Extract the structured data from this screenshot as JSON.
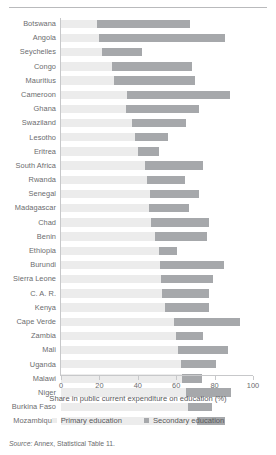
{
  "chart_data": {
    "type": "bar",
    "orientation": "horizontal",
    "stacked": true,
    "title": "",
    "xlabel": "Share in public current expenditure on education (%)",
    "ylabel": "",
    "xlim": [
      0,
      100
    ],
    "xticks": [
      0,
      20,
      40,
      60,
      80,
      100
    ],
    "grid": false,
    "legend_position": "bottom",
    "categories": [
      "Botswana",
      "Angola",
      "Seychelles",
      "Congo",
      "Mauritius",
      "Cameroon",
      "Ghana",
      "Swaziland",
      "Lesotho",
      "Eritrea",
      "South Africa",
      "Rwanda",
      "Senegal",
      "Madagascar",
      "Chad",
      "Benin",
      "Ethiopia",
      "Burundi",
      "Sierra Leone",
      "C. A. R.",
      "Kenya",
      "Cape Verde",
      "Zambia",
      "Mali",
      "Uganda",
      "Malawi",
      "Niger",
      "Burkina Faso",
      "Mozambique"
    ],
    "series": [
      {
        "name": "Primary education",
        "color": "#ececec",
        "values": [
          18.6,
          20.0,
          21.2,
          26.4,
          27.8,
          34.3,
          33.8,
          37.2,
          38.3,
          40.0,
          43.8,
          44.7,
          46.1,
          45.9,
          47.0,
          49.0,
          50.8,
          51.6,
          52.2,
          52.5,
          54.3,
          59.1,
          59.8,
          60.9,
          62.6,
          62.9,
          65.0,
          66.0,
          70.7
        ]
      },
      {
        "name": "Secondary education",
        "color": "#a6a8ab",
        "values": [
          48.7,
          65.6,
          21.2,
          41.7,
          42.1,
          53.9,
          38.2,
          27.8,
          17.2,
          10.8,
          30.1,
          20.0,
          25.6,
          21.0,
          29.9,
          27.0,
          9.5,
          33.1,
          26.8,
          24.7,
          22.9,
          34.3,
          14.1,
          26.1,
          18.3,
          10.5,
          23.7,
          12.6,
          14.9
        ]
      }
    ],
    "totals": [
      67.3,
      85.6,
      42.4,
      68.1,
      69.9,
      88.2,
      72.0,
      65.0,
      55.5,
      50.8,
      73.9,
      64.7,
      71.7,
      66.9,
      76.9,
      76.0,
      60.3,
      84.7,
      79.0,
      77.2,
      77.2,
      93.4,
      73.9,
      87.0,
      80.9,
      73.4,
      88.7,
      78.6,
      85.6
    ]
  },
  "legend": {
    "items": [
      {
        "label": "Primary education",
        "swatch": "primary"
      },
      {
        "label": "Secondary education",
        "swatch": "secondary"
      }
    ]
  },
  "source": {
    "prefix": "Source:",
    "text": " Annex, Statistical Table 11."
  }
}
